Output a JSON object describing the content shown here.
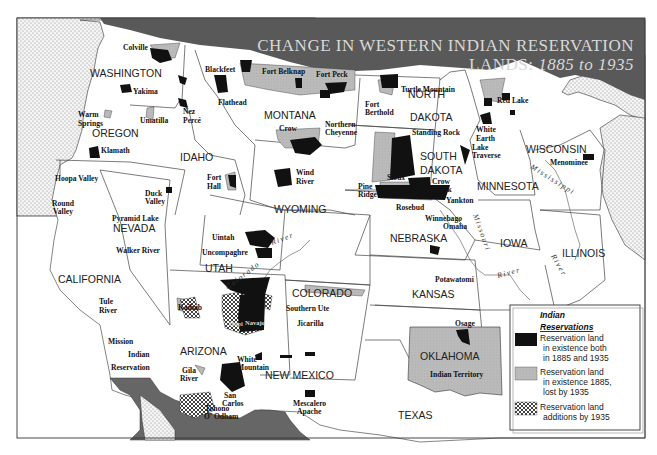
{
  "title": {
    "line1": "CHANGE IN WESTERN INDIAN RESERVATION",
    "line2_prefix": "LANDS:",
    "line2_years": "1885 to 1935"
  },
  "colors": {
    "existing_both": "#111111",
    "lost_by_1935": "#b8b8b8",
    "added_by_1935": "crosshatch",
    "foreign_land": "#666666",
    "water": "#f3f3f3",
    "states": "#ffffff",
    "title_band": "#5a5a5a"
  },
  "states": [
    {
      "name": "WASHINGTON"
    },
    {
      "name": "OREGON"
    },
    {
      "name": "CALIFORNIA"
    },
    {
      "name": "NEVADA"
    },
    {
      "name": "IDAHO"
    },
    {
      "name": "MONTANA"
    },
    {
      "name": "WYOMING"
    },
    {
      "name": "UTAH"
    },
    {
      "name": "ARIZONA"
    },
    {
      "name": "COLORADO"
    },
    {
      "name": "NEW MEXICO"
    },
    {
      "name": "NORTH"
    },
    {
      "name": "DAKOTA"
    },
    {
      "name": "SOUTH"
    },
    {
      "name": "DAKOTA"
    },
    {
      "name": "NEBRASKA"
    },
    {
      "name": "KANSAS"
    },
    {
      "name": "OKLAHOMA"
    },
    {
      "name": "TEXAS"
    },
    {
      "name": "MINNESOTA"
    },
    {
      "name": "IOWA"
    },
    {
      "name": "WISCONSIN"
    },
    {
      "name": "ILLINOIS"
    }
  ],
  "reservations": [
    {
      "name": "Colville"
    },
    {
      "name": "Yakima"
    },
    {
      "name": "Warm"
    },
    {
      "name": "Springs"
    },
    {
      "name": "Umatilla"
    },
    {
      "name": "Nez"
    },
    {
      "name": "Percé"
    },
    {
      "name": "Klamath"
    },
    {
      "name": "Blackfeet"
    },
    {
      "name": "Flathead"
    },
    {
      "name": "Fort Belknap"
    },
    {
      "name": "Fort Peck"
    },
    {
      "name": "Crow"
    },
    {
      "name": "Northern"
    },
    {
      "name": "Cheyenne"
    },
    {
      "name": "Fort"
    },
    {
      "name": "Hall"
    },
    {
      "name": "Wind"
    },
    {
      "name": "River"
    },
    {
      "name": "Hoopa Valley"
    },
    {
      "name": "Round"
    },
    {
      "name": "Valley"
    },
    {
      "name": "Duck"
    },
    {
      "name": "Valley"
    },
    {
      "name": "Pyramid Lake"
    },
    {
      "name": "Walker River"
    },
    {
      "name": "Uintah"
    },
    {
      "name": "Uncompaghre"
    },
    {
      "name": "Tule"
    },
    {
      "name": "River"
    },
    {
      "name": "Kaibab"
    },
    {
      "name": "Ute"
    },
    {
      "name": "Mt."
    },
    {
      "name": "Southern Ute"
    },
    {
      "name": "Jicarilla"
    },
    {
      "name": "Hopi"
    },
    {
      "name": "Navajo"
    },
    {
      "name": "Mission"
    },
    {
      "name": "Indian"
    },
    {
      "name": "Reservation"
    },
    {
      "name": "White"
    },
    {
      "name": "Mountain"
    },
    {
      "name": "Gila"
    },
    {
      "name": "River"
    },
    {
      "name": "San"
    },
    {
      "name": "Carlos"
    },
    {
      "name": "Tohono"
    },
    {
      "name": "O' Odham"
    },
    {
      "name": "Mescalero"
    },
    {
      "name": "Apache"
    },
    {
      "name": "Turtle Mountain"
    },
    {
      "name": "Fort"
    },
    {
      "name": "Berthold"
    },
    {
      "name": "Standing Rock"
    },
    {
      "name": "Sioux"
    },
    {
      "name": "Crow"
    },
    {
      "name": "Creek"
    },
    {
      "name": "Pine"
    },
    {
      "name": "Ridge"
    },
    {
      "name": "Rosebud"
    },
    {
      "name": "Yankton"
    },
    {
      "name": "Winnebago"
    },
    {
      "name": "Omaha"
    },
    {
      "name": "Red Lake"
    },
    {
      "name": "White"
    },
    {
      "name": "Earth"
    },
    {
      "name": "Lake"
    },
    {
      "name": "Traverse"
    },
    {
      "name": "Menominee"
    },
    {
      "name": "Potawatomi"
    },
    {
      "name": "Osage"
    },
    {
      "name": "Indian Territory"
    }
  ],
  "rivers": [
    {
      "name": "Colorado"
    },
    {
      "name": "River"
    },
    {
      "name": "Mississippi"
    },
    {
      "name": "Missouri"
    },
    {
      "name": "River"
    },
    {
      "name": "River"
    }
  ],
  "legend": {
    "title_line1": "Indian",
    "title_line2": "Reservations",
    "items": [
      {
        "line1": "Reservation land",
        "line2": "in existence both",
        "line3": "in 1885 and 1935"
      },
      {
        "line1": "Reservation land",
        "line2": "in existence 1885,",
        "line3": "lost by 1935"
      },
      {
        "line1": "Reservation land",
        "line2": "additions by 1935"
      }
    ]
  }
}
